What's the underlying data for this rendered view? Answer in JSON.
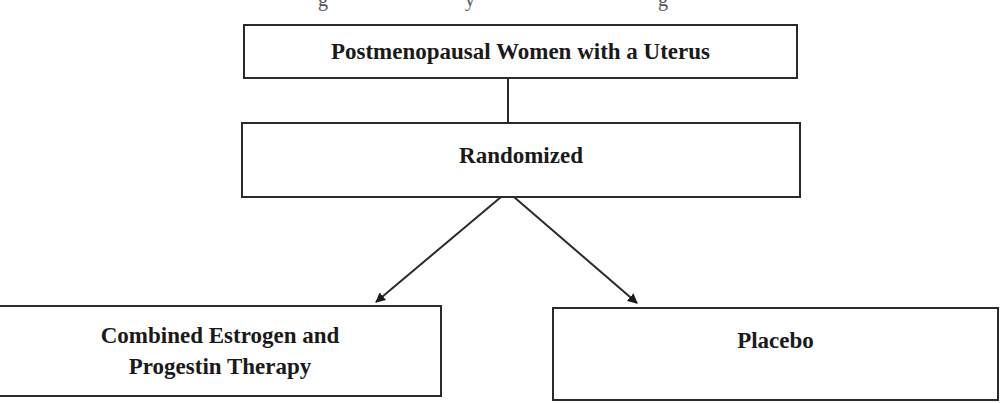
{
  "title_fragment": {
    "note": "Figure title above is cut off at the top edge; only descenders are visible"
  },
  "diagram": {
    "type": "flowchart",
    "colors": {
      "stroke": "#2a2a2a",
      "text": "#1a1a1a",
      "background": "#ffffff"
    },
    "nodes": [
      {
        "id": "population",
        "label": "Postmenopausal Women with a Uterus"
      },
      {
        "id": "randomized",
        "label": "Randomized"
      },
      {
        "id": "treatment",
        "label_line1": "Combined Estrogen and",
        "label_line2": "Progestin Therapy"
      },
      {
        "id": "placebo",
        "label": "Placebo"
      }
    ],
    "edges": [
      {
        "from": "population",
        "to": "randomized",
        "style": "line"
      },
      {
        "from": "randomized",
        "to": "treatment",
        "style": "arrow"
      },
      {
        "from": "randomized",
        "to": "placebo",
        "style": "arrow"
      }
    ]
  }
}
